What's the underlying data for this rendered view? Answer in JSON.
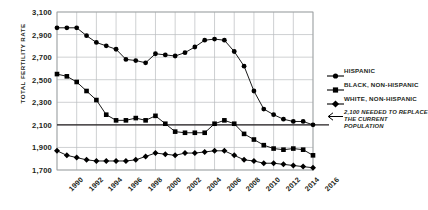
{
  "chart_data": {
    "type": "line",
    "title": "",
    "xlabel": "",
    "ylabel": "TOTAL FERTILITY RATE",
    "ylim": [
      1700,
      3100
    ],
    "ytick_labels": [
      "3,100",
      "2,900",
      "2,700",
      "2,500",
      "2,300",
      "2,100",
      "1,900",
      "1,700"
    ],
    "ytick_values": [
      3100,
      2900,
      2700,
      2500,
      2300,
      2100,
      1900,
      1700
    ],
    "xtick_labels": [
      "1990",
      "1992",
      "1994",
      "1996",
      "1998",
      "2000",
      "2002",
      "2004",
      "2006",
      "2008",
      "2010",
      "2012",
      "2014",
      "2016"
    ],
    "xtick_values": [
      1990,
      1992,
      1994,
      1996,
      1998,
      2000,
      2002,
      2004,
      2006,
      2008,
      2010,
      2012,
      2014,
      2016
    ],
    "x": [
      1990,
      1991,
      1992,
      1993,
      1994,
      1995,
      1996,
      1997,
      1998,
      1999,
      2000,
      2001,
      2002,
      2003,
      2004,
      2005,
      2006,
      2007,
      2008,
      2009,
      2010,
      2011,
      2012,
      2013,
      2014,
      2015,
      2016
    ],
    "grid": true,
    "legend_position": "right",
    "series": [
      {
        "name": "HISPANIC",
        "marker": "circle",
        "color": "#000000",
        "values": [
          2960,
          2960,
          2960,
          2890,
          2830,
          2800,
          2770,
          2680,
          2670,
          2650,
          2730,
          2720,
          2710,
          2740,
          2790,
          2850,
          2860,
          2850,
          2750,
          2620,
          2400,
          2240,
          2190,
          2150,
          2130,
          2130,
          2100
        ]
      },
      {
        "name": "BLACK, NON-HISPANIC",
        "marker": "square",
        "color": "#000000",
        "values": [
          2550,
          2530,
          2480,
          2400,
          2320,
          2190,
          2140,
          2140,
          2160,
          2140,
          2180,
          2110,
          2040,
          2030,
          2030,
          2030,
          2110,
          2140,
          2110,
          2020,
          1970,
          1920,
          1890,
          1880,
          1890,
          1880,
          1830
        ]
      },
      {
        "name": "WHITE, NON-HISPANIC",
        "marker": "diamond",
        "color": "#000000",
        "values": [
          1870,
          1830,
          1810,
          1790,
          1780,
          1780,
          1780,
          1780,
          1790,
          1820,
          1850,
          1840,
          1830,
          1850,
          1850,
          1860,
          1870,
          1870,
          1830,
          1790,
          1780,
          1760,
          1760,
          1750,
          1740,
          1730,
          1720
        ]
      }
    ],
    "reference_line": {
      "value": 2100,
      "label_line1": "2,100 NEEDED TO REPLACE",
      "label_line2": "THE CURRENT POPULATION",
      "marker": "arrow-left-icon"
    }
  },
  "legend": {
    "items": [
      {
        "label": "HISPANIC",
        "marker": "circle"
      },
      {
        "label": "BLACK, NON-HISPANIC",
        "marker": "square"
      },
      {
        "label": "WHITE, NON-HISPANIC",
        "marker": "diamond"
      }
    ]
  }
}
